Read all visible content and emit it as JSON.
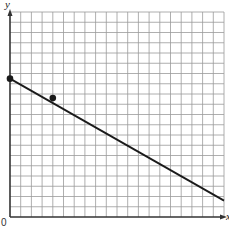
{
  "chart_data": {
    "type": "line",
    "title": "",
    "xlabel": "x",
    "ylabel": "y",
    "origin_label": "0",
    "grid": true,
    "grid_cells": {
      "x": 20,
      "y": 20
    },
    "xlim": [
      0,
      20
    ],
    "ylim": [
      0,
      20
    ],
    "tick_labels": [],
    "series": [
      {
        "name": "line",
        "x": [
          0,
          20
        ],
        "y": [
          13.5,
          1.6
        ]
      }
    ],
    "points": [
      {
        "x": 0,
        "y": 13.5
      },
      {
        "x": 4,
        "y": 11.6
      }
    ],
    "colors": {
      "line": "#1a1a1a",
      "grid": "#9a9a9a",
      "axis": "#333333"
    }
  }
}
